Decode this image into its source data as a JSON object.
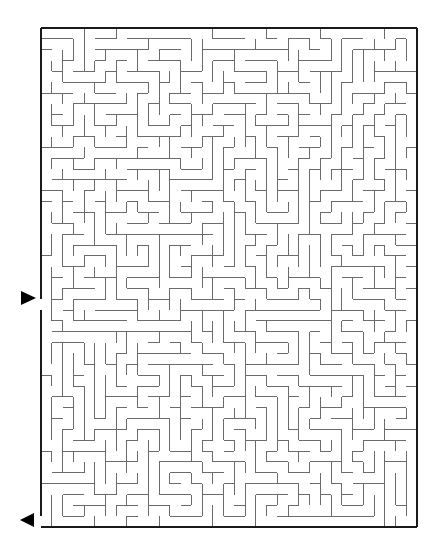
{
  "maze": {
    "frame": {
      "left": 41,
      "top": 28,
      "right": 417,
      "bottom": 527
    },
    "cols": 35,
    "rows": 46,
    "seed": 73421,
    "wall_color": "#6b6b6b",
    "frame_color": "#1a1a1a",
    "entrance": {
      "side": "left",
      "row": 25,
      "label": "start"
    },
    "exit": {
      "side": "left",
      "row": 45,
      "label": "finish"
    }
  },
  "markers": {
    "entrance_arrow": {
      "direction": "right",
      "x": 21,
      "y": 298,
      "icon": "triangle-right-icon"
    },
    "exit_arrow": {
      "direction": "left",
      "x": 20,
      "y": 520,
      "icon": "triangle-left-icon"
    }
  }
}
